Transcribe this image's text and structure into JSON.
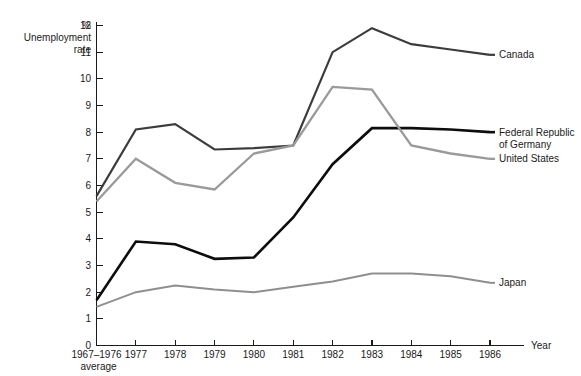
{
  "chart_data": {
    "type": "line",
    "title": "",
    "ylabel": "Unemployment rate",
    "yunit": "%",
    "xlabel": "Year",
    "ylim": [
      0,
      12
    ],
    "yticks": [
      0,
      1,
      2,
      3,
      4,
      5,
      6,
      7,
      8,
      9,
      10,
      11,
      12
    ],
    "ytick_labels": [
      "0",
      "1",
      "2",
      "3",
      "4",
      "5",
      "6",
      "7",
      "8",
      "9",
      "10",
      "11",
      "12"
    ],
    "grid": false,
    "legend_position": "right-inline",
    "categories": [
      "1967-1976 average",
      "1977",
      "1978",
      "1979",
      "1980",
      "1981",
      "1982",
      "1983",
      "1984",
      "1985",
      "1986"
    ],
    "xtick_labels": [
      "1967–1976",
      "1977",
      "1978",
      "1979",
      "1980",
      "1981",
      "1982",
      "1983",
      "1984",
      "1985",
      "1986"
    ],
    "xtick_sublabel_first": "average",
    "series": [
      {
        "name": "Canada",
        "color": "#3c3c3c",
        "width": 2.2,
        "values": [
          5.6,
          8.1,
          8.3,
          7.35,
          7.4,
          7.5,
          11.0,
          11.9,
          11.3,
          11.1,
          10.9
        ]
      },
      {
        "name": "Federal Republic of Germany",
        "color": "#0d0d0d",
        "width": 2.6,
        "values": [
          1.7,
          3.9,
          3.8,
          3.25,
          3.3,
          4.8,
          6.8,
          8.15,
          8.15,
          8.1,
          8.0
        ]
      },
      {
        "name": "United States",
        "color": "#9a9a9a",
        "width": 2.3,
        "values": [
          5.4,
          7.0,
          6.1,
          5.85,
          7.2,
          7.5,
          9.7,
          9.6,
          7.5,
          7.2,
          7.0
        ]
      },
      {
        "name": "Japan",
        "color": "#8f8f8f",
        "width": 2.0,
        "values": [
          1.45,
          2.0,
          2.25,
          2.1,
          2.0,
          2.2,
          2.4,
          2.7,
          2.7,
          2.6,
          2.35
        ]
      }
    ],
    "legend_labels": [
      {
        "key": "canada",
        "line1": "Canada",
        "line2": ""
      },
      {
        "key": "germany",
        "line1": "Federal Republic",
        "line2": "of Germany"
      },
      {
        "key": "united-states",
        "line1": "United States",
        "line2": ""
      },
      {
        "key": "japan",
        "line1": "Japan",
        "line2": ""
      }
    ]
  },
  "axis": {
    "y_label_line1": "Unemployment",
    "y_label_line2": "rate",
    "y_unit": "%",
    "x_label": "Year"
  }
}
